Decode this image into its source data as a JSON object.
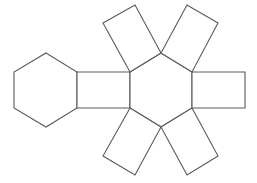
{
  "diagram": {
    "canvas": {
      "width": 257,
      "height": 183
    },
    "style": {
      "stroke": "#5a5a5a",
      "fill": "#ffffff",
      "background": "#ffffff"
    },
    "faces": [
      {
        "id": "hexagon-left",
        "shape": "hexagon",
        "points": "46,53 77,72 77,108 46,127 14,108 14,72"
      },
      {
        "id": "rect-left",
        "shape": "rectangle",
        "points": "77,72 130,72 130,108 77,108"
      },
      {
        "id": "hexagon-center",
        "shape": "hexagon",
        "points": "161,53 192,72 192,108 161,127 130,108 130,72"
      },
      {
        "id": "rect-right",
        "shape": "rectangle",
        "points": "192,72 245,72 245,108 192,108"
      },
      {
        "id": "rect-upper-left",
        "shape": "rectangle",
        "points": "130,72 161,53 135,5 103,23"
      },
      {
        "id": "rect-upper-right",
        "shape": "rectangle",
        "points": "161,53 192,72 218,23 187,5"
      },
      {
        "id": "rect-lower-left",
        "shape": "rectangle",
        "points": "130,108 161,127 135,175 103,156"
      },
      {
        "id": "rect-lower-right",
        "shape": "rectangle",
        "points": "161,127 192,108 218,156 187,175"
      }
    ]
  }
}
